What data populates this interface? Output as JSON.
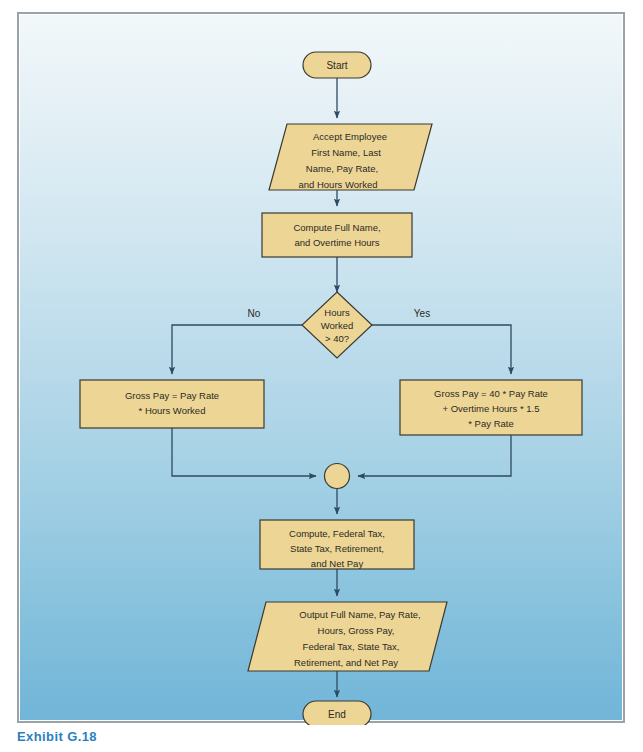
{
  "figure": {
    "caption": "Exhibit G.18",
    "background_top_color": "#f2f8fa",
    "background_bottom_color": "#71b5d8",
    "shape_fill_color": "#edd596",
    "shape_stroke_color": "#3a3a30",
    "connector_color": "#2d4a63",
    "caption_color": "#2b7fc1"
  },
  "flowchart": {
    "type": "flowchart",
    "title": "Payroll calculation flowchart",
    "nodes": [
      {
        "id": "start",
        "kind": "terminator",
        "lines": [
          "Start"
        ]
      },
      {
        "id": "accept-input",
        "kind": "input-output",
        "lines": [
          "Accept Employee",
          "First Name, Last",
          "Name, Pay Rate,",
          "and Hours Worked"
        ]
      },
      {
        "id": "compute-name",
        "kind": "process",
        "lines": [
          "Compute Full Name,",
          "and Overtime Hours"
        ]
      },
      {
        "id": "hours-decision",
        "kind": "decision",
        "lines": [
          "Hours",
          "Worked",
          "> 40?"
        ]
      },
      {
        "id": "gross-pay-regular",
        "kind": "process",
        "lines": [
          "Gross Pay = Pay Rate",
          "* Hours Worked"
        ]
      },
      {
        "id": "gross-pay-overtime",
        "kind": "process",
        "lines": [
          "Gross Pay = 40 * Pay Rate",
          "+ Overtime Hours * 1.5",
          "* Pay Rate"
        ]
      },
      {
        "id": "merge",
        "kind": "connector",
        "lines": []
      },
      {
        "id": "compute-tax",
        "kind": "process",
        "lines": [
          "Compute, Federal Tax,",
          "State Tax, Retirement,",
          "and Net Pay"
        ]
      },
      {
        "id": "output",
        "kind": "input-output",
        "lines": [
          "Output Full Name, Pay Rate,",
          "Hours, Gross Pay,",
          "Federal Tax, State Tax,",
          "Retirement, and Net Pay"
        ]
      },
      {
        "id": "end",
        "kind": "terminator",
        "lines": [
          "End"
        ]
      }
    ],
    "edge_labels": {
      "no": "No",
      "yes": "Yes"
    }
  }
}
